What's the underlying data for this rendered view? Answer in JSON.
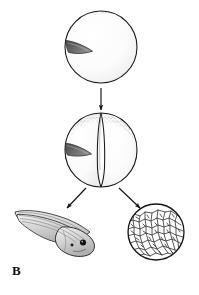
{
  "figure": {
    "panel_label": "B",
    "caption_text": "",
    "background_color": "#ffffff",
    "ink_color": "#1a1a1a",
    "stipple_color": "#9a9a9a",
    "gray_crescent_color": "#6e6e6e",
    "body_fill_color": "#d8d8d8",
    "width": 199,
    "height": 295
  },
  "stages": [
    {
      "id": "fertilized-egg",
      "name": "fertilized-egg",
      "label": "",
      "shape": "sphere",
      "center": {
        "x": 101,
        "y": 47
      },
      "radius": 36,
      "features": [
        "pigmented-animal-pole-stipple",
        "gray-crescent-wedge"
      ]
    },
    {
      "id": "two-cell-stage",
      "name": "two-cell-stage",
      "label": "",
      "shape": "two-blastomeres",
      "center": {
        "x": 101,
        "y": 150
      },
      "radius": 36,
      "features": [
        "cleavage-furrow",
        "pigmented-animal-pole-stipple",
        "gray-crescent-wedge"
      ]
    },
    {
      "id": "tadpole",
      "name": "tadpole-larva",
      "label": "",
      "shape": "tadpole",
      "center": {
        "x": 52,
        "y": 230
      },
      "features": [
        "tail-fin",
        "head",
        "eye-spot",
        "pigment-spot"
      ]
    },
    {
      "id": "cell-mass",
      "name": "blastula-cell-mass",
      "label": "",
      "shape": "sphere-of-cells",
      "center": {
        "x": 156,
        "y": 232
      },
      "radius": 28,
      "features": [
        "polygonal-cell-outlines"
      ]
    }
  ],
  "arrows": [
    {
      "id": "arrow-egg-to-two-cell",
      "name": "arrow-egg-to-two-cell",
      "from": "fertilized-egg",
      "to": "two-cell-stage",
      "direction": "down",
      "start": {
        "x": 101,
        "y": 88
      },
      "end": {
        "x": 101,
        "y": 111
      }
    },
    {
      "id": "arrow-two-cell-to-tadpole",
      "name": "arrow-two-cell-to-tadpole",
      "from": "two-cell-stage",
      "to": "tadpole",
      "direction": "down-left",
      "start": {
        "x": 85,
        "y": 186
      },
      "end": {
        "x": 66,
        "y": 209
      }
    },
    {
      "id": "arrow-two-cell-to-cell-mass",
      "name": "arrow-two-cell-to-cell-mass",
      "from": "two-cell-stage",
      "to": "cell-mass",
      "direction": "down-right",
      "start": {
        "x": 120,
        "y": 186
      },
      "end": {
        "x": 142,
        "y": 209
      }
    }
  ]
}
